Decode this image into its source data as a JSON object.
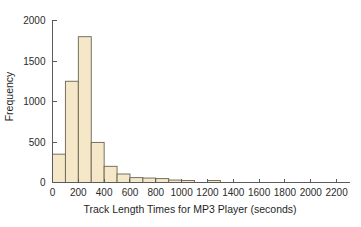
{
  "chart_data": {
    "type": "bar",
    "chart_subtype": "histogram",
    "title": "",
    "xlabel": "Track Length Times for MP3 Player (seconds)",
    "ylabel": "Frequency",
    "xlim": [
      0,
      2300
    ],
    "ylim": [
      0,
      2100
    ],
    "grid": false,
    "legend": null,
    "bin_width": 100,
    "xticks": [
      0,
      200,
      400,
      600,
      800,
      1000,
      1200,
      1400,
      1600,
      1800,
      2000,
      2200
    ],
    "xtick_labels": [
      "0",
      "200",
      "400",
      "600",
      "800",
      "1000",
      "1200",
      "1400",
      "1600",
      "1800",
      "2000",
      "2200"
    ],
    "yticks": [
      0,
      500,
      1000,
      1500,
      2000
    ],
    "ytick_labels": [
      "0",
      "500",
      "1000",
      "1500",
      "2000"
    ],
    "bin_edges": [
      0,
      100,
      200,
      300,
      400,
      500,
      600,
      700,
      800,
      900,
      1000,
      1100,
      1200,
      1300
    ],
    "bins": [
      {
        "x_left": 0,
        "x_right": 100,
        "value": 350
      },
      {
        "x_left": 100,
        "x_right": 200,
        "value": 1250
      },
      {
        "x_left": 200,
        "x_right": 300,
        "value": 1800
      },
      {
        "x_left": 300,
        "x_right": 400,
        "value": 495
      },
      {
        "x_left": 400,
        "x_right": 500,
        "value": 200
      },
      {
        "x_left": 500,
        "x_right": 600,
        "value": 105
      },
      {
        "x_left": 600,
        "x_right": 700,
        "value": 60
      },
      {
        "x_left": 700,
        "x_right": 800,
        "value": 55
      },
      {
        "x_left": 800,
        "x_right": 900,
        "value": 48
      },
      {
        "x_left": 900,
        "x_right": 1000,
        "value": 30
      },
      {
        "x_left": 1000,
        "x_right": 1100,
        "value": 25
      },
      {
        "x_left": 1200,
        "x_right": 1300,
        "value": 25
      }
    ],
    "categories": [
      "0-100",
      "100-200",
      "200-300",
      "300-400",
      "400-500",
      "500-600",
      "600-700",
      "700-800",
      "800-900",
      "900-1000",
      "1000-1100",
      "1200-1300"
    ],
    "values": [
      350,
      1250,
      1800,
      495,
      200,
      105,
      60,
      55,
      48,
      30,
      25,
      25
    ],
    "colors": {
      "bar_fill": "#f5e8c8",
      "bar_stroke": "#6a6252",
      "axis": "#5b5b5b",
      "text": "#1f1f1f",
      "background": "#ffffff"
    }
  }
}
